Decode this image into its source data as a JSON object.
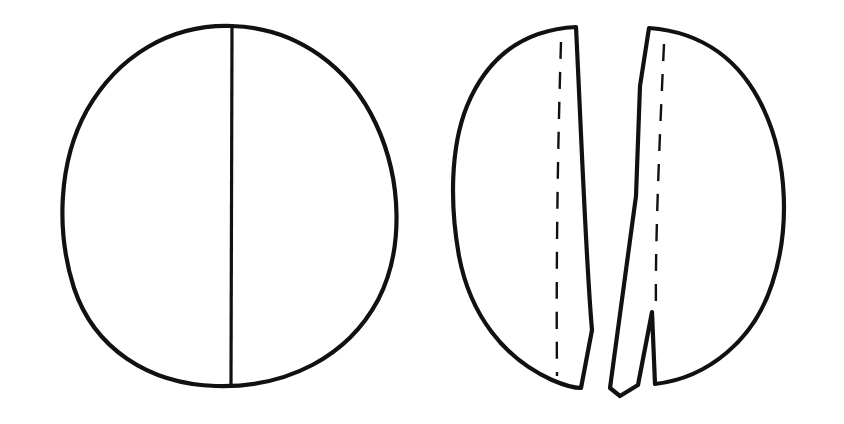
{
  "document": {
    "title": "Split seed line drawing",
    "background_color": "#ffffff",
    "ink_color": "#111111",
    "width": 844,
    "height": 424
  },
  "figure": {
    "name": "two-panel-seed-diagram",
    "panel_count": 2,
    "panels": [
      {
        "id": "panel-left",
        "label": "",
        "name": "intact-seed-panel",
        "description": "Whole rounded seed outline with a single vertical median line running from top edge to bottom edge",
        "bounds": {
          "x": 57,
          "y": 22,
          "width": 343,
          "height": 365
        },
        "features": [
          {
            "name": "seed-outline",
            "type": "closed-contour",
            "shape": "rounded-irregular-circle"
          },
          {
            "name": "median-line",
            "type": "solid-line",
            "orientation": "vertical",
            "x": 232,
            "y_top": 26,
            "y_bottom": 385
          }
        ]
      },
      {
        "id": "panel-right",
        "label": "",
        "name": "split-seed-panel",
        "description": "The same seed separated into two halves with a narrow gap between them; each half carries a dashed seam line near its flat face; the right half has a thin tapering sliver and a V-shaped notch at the lower flat edge",
        "bounds": {
          "x": 452,
          "y": 22,
          "width": 341,
          "height": 378
        },
        "features": [
          {
            "name": "left-half-outline",
            "type": "closed-contour",
            "shape": "half-disc-flat-right"
          },
          {
            "name": "left-half-dashed-seam",
            "type": "dashed-line",
            "orientation": "vertical"
          },
          {
            "name": "right-half-outline",
            "type": "closed-contour",
            "shape": "half-disc-flat-left-with-sliver"
          },
          {
            "name": "right-half-dashed-seam",
            "type": "dashed-line",
            "orientation": "vertical"
          },
          {
            "name": "separation-gap",
            "type": "void",
            "orientation": "vertical"
          },
          {
            "name": "v-notch",
            "type": "notch",
            "position": "lower-left-of-right-half"
          },
          {
            "name": "tapering-sliver",
            "type": "thin-wedge",
            "position": "bottom-center"
          }
        ]
      }
    ]
  },
  "geometry": {
    "left_panel": {
      "outline_path": "M 232 26 C 170 24 118 56 87 110 C 58 162 56 232 74 288 C 94 348 148 384 216 386 C 288 388 348 356 378 300 C 404 250 402 180 376 124 C 350 68 298 28 232 26 Z",
      "median_line_path": "M 232 27 C 231 120 231 250 231 385"
    },
    "right_panel": {
      "left_half_path": "M 576 27 C 520 30 486 60 467 106 C 450 148 450 206 459 256 C 470 314 503 358 552 380 C 566 386 576 388 581 388 L 592 330 C 586 262 582 150 576 27 Z",
      "left_half_dashed_path": "M 561 42 C 558 140 556 250 557 376",
      "right_half_path": "M 649 28 C 704 32 742 62 764 110 C 788 162 790 230 772 284 C 754 340 708 378 655 384 L 652 312 L 638 385 L 620 396 L 610 388 L 636 196 L 640 86 Z",
      "right_half_dashed_path": "M 664 44 C 659 150 655 250 656 310",
      "notch_path": "M 652 312 L 638 385"
    }
  }
}
